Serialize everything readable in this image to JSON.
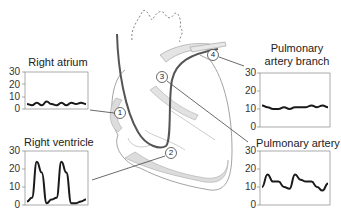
{
  "diagram": {
    "markers": [
      {
        "id": "1",
        "label": "1",
        "site": "Right atrium"
      },
      {
        "id": "2",
        "label": "2",
        "site": "Right ventricle"
      },
      {
        "id": "3",
        "label": "3",
        "site": "Pulmonary artery"
      },
      {
        "id": "4",
        "label": "4",
        "site": "Pulmonary artery branch"
      }
    ],
    "colors": {
      "tissue_fill": "#dcdcdc",
      "outline": "#9a9a9a",
      "catheter": "#555555",
      "trace": "#1a1a1a"
    }
  },
  "charts": {
    "right_atrium": {
      "title": "Right atrium",
      "ticks": [
        "30",
        "20",
        "10",
        "0"
      ]
    },
    "right_ventricle": {
      "title": "Right ventricle",
      "ticks": [
        "30",
        "20",
        "10",
        "0"
      ]
    },
    "pa_branch": {
      "title_line1": "Pulmonary",
      "title_line2": "artery branch",
      "ticks": [
        "30",
        "20",
        "10",
        "0"
      ]
    },
    "pulmonary_artery": {
      "title": "Pulmonary artery",
      "ticks": [
        "30",
        "20",
        "10",
        "0"
      ]
    }
  },
  "chart_data": [
    {
      "type": "line",
      "title": "Right atrium",
      "ylim": [
        0,
        30
      ],
      "yticks": [
        0,
        10,
        20,
        30
      ],
      "x": [
        0,
        1,
        2,
        3,
        4,
        5,
        6,
        7,
        8,
        9,
        10,
        11,
        12
      ],
      "values": [
        4,
        3,
        5,
        3,
        6,
        4,
        3,
        5,
        3,
        5,
        4,
        5,
        4
      ]
    },
    {
      "type": "line",
      "title": "Right ventricle",
      "ylim": [
        0,
        30
      ],
      "yticks": [
        0,
        10,
        20,
        30
      ],
      "x": [
        0,
        1,
        2,
        3,
        4,
        5,
        6,
        7,
        8,
        9,
        10,
        11,
        12
      ],
      "values": [
        2,
        4,
        24,
        18,
        1,
        3,
        4,
        24,
        18,
        1,
        1,
        2,
        3
      ]
    },
    {
      "type": "line",
      "title": "Pulmonary artery branch",
      "ylim": [
        0,
        30
      ],
      "yticks": [
        0,
        10,
        20,
        30
      ],
      "x": [
        0,
        1,
        2,
        3,
        4,
        5,
        6,
        7,
        8,
        9,
        10,
        11,
        12
      ],
      "values": [
        12,
        11,
        10,
        10,
        11,
        10,
        11,
        11,
        11,
        12,
        11,
        12,
        11
      ]
    },
    {
      "type": "line",
      "title": "Pulmonary artery",
      "ylim": [
        0,
        30
      ],
      "yticks": [
        0,
        10,
        20,
        30
      ],
      "x": [
        0,
        1,
        2,
        3,
        4,
        5,
        6,
        7,
        8,
        9,
        10,
        11,
        12
      ],
      "values": [
        10,
        17,
        13,
        13,
        10,
        9,
        17,
        14,
        13,
        13,
        10,
        8,
        12
      ]
    }
  ]
}
